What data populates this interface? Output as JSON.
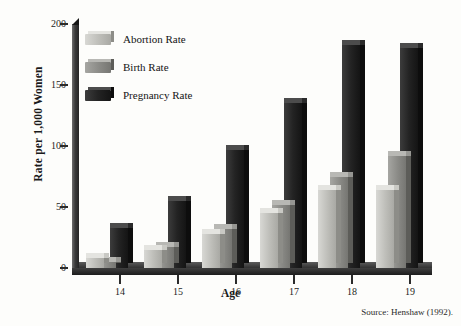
{
  "chart_data": {
    "type": "bar",
    "title": "",
    "subtitle": "",
    "xlabel": "Age",
    "ylabel": "Rate per 1,000 Women",
    "categories": [
      "14",
      "15",
      "16",
      "17",
      "18",
      "19"
    ],
    "series": [
      {
        "name": "Abortion Rate",
        "values": [
          8,
          15,
          28,
          45,
          64,
          64
        ],
        "color": "#bdbdb8"
      },
      {
        "name": "Birth Rate",
        "values": [
          5,
          17,
          32,
          52,
          75,
          92
        ],
        "color": "#8a8a86"
      },
      {
        "name": "Pregnancy Rate",
        "values": [
          33,
          55,
          97,
          135,
          183,
          180
        ],
        "color": "#232323"
      }
    ],
    "ylim": [
      0,
      200
    ],
    "yticks": [
      0,
      50,
      100,
      150,
      200
    ],
    "ytick_labels": [
      "0",
      "50",
      "100",
      "150",
      "200"
    ],
    "grid": false,
    "legend_position": "top-left",
    "annotations": [
      "Source: Henshaw (1992)."
    ]
  },
  "axes": {
    "y_title": "Rate per 1,000 Women",
    "x_title": "Age",
    "y_ticks": [
      {
        "label": "200",
        "value": 200
      },
      {
        "label": "150",
        "value": 150
      },
      {
        "label": "100",
        "value": 100
      },
      {
        "label": "50",
        "value": 50
      },
      {
        "label": "0",
        "value": 0
      }
    ],
    "x_ticks": [
      {
        "label": "14"
      },
      {
        "label": "15"
      },
      {
        "label": "16"
      },
      {
        "label": "17"
      },
      {
        "label": "18"
      },
      {
        "label": "19"
      }
    ]
  },
  "legend": {
    "items": [
      {
        "label": "Abortion Rate",
        "swatch": "light-grey-bar-swatch"
      },
      {
        "label": "Birth Rate",
        "swatch": "medium-grey-bar-swatch"
      },
      {
        "label": "Pregnancy Rate",
        "swatch": "black-bar-swatch"
      }
    ]
  },
  "footer": {
    "source": "Source: Henshaw (1992)."
  }
}
